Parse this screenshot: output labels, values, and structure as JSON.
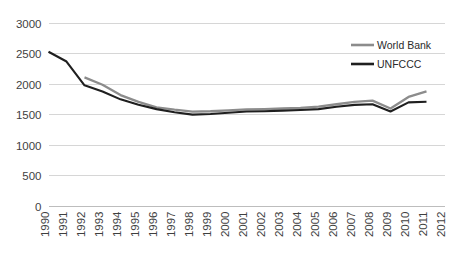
{
  "chart_data": {
    "type": "line",
    "title": "",
    "subtitle": "",
    "xlabel": "",
    "ylabel": "",
    "grid": true,
    "legend_position": "top-right",
    "ylim": [
      0,
      3000
    ],
    "ytick_values": [
      0,
      500,
      1000,
      1500,
      2000,
      2500,
      3000
    ],
    "ytick_labels": [
      "0",
      "500",
      "1000",
      "1500",
      "2000",
      "2500",
      "3000"
    ],
    "categories": [
      "1990",
      "1991",
      "1992",
      "1993",
      "1994",
      "1995",
      "1996",
      "1997",
      "1998",
      "1999",
      "2000",
      "2001",
      "2002",
      "2003",
      "2004",
      "2005",
      "2006",
      "2007",
      "2008",
      "2009",
      "2010",
      "2011",
      "2012"
    ],
    "x": [
      1990,
      1991,
      1992,
      1993,
      1994,
      1995,
      1996,
      1997,
      1998,
      1999,
      2000,
      2001,
      2002,
      2003,
      2004,
      2005,
      2006,
      2007,
      2008,
      2009,
      2010,
      2011,
      2012
    ],
    "series": [
      {
        "name": "World Bank",
        "color": "#8c8c8c",
        "values": [
          null,
          null,
          2100,
          1980,
          1810,
          1700,
          1610,
          1570,
          1540,
          1545,
          1560,
          1575,
          1580,
          1590,
          1600,
          1620,
          1660,
          1700,
          1720,
          1590,
          1780,
          1870,
          null
        ]
      },
      {
        "name": "UNFCCC",
        "color": "#1f1f1f",
        "values": [
          2520,
          2360,
          1970,
          1870,
          1740,
          1650,
          1580,
          1530,
          1490,
          1500,
          1520,
          1540,
          1545,
          1555,
          1565,
          1580,
          1620,
          1650,
          1660,
          1540,
          1690,
          1700,
          null
        ]
      }
    ]
  },
  "legend": {
    "entries": [
      {
        "label": "World Bank",
        "color": "#8c8c8c"
      },
      {
        "label": "UNFCCC",
        "color": "#1f1f1f"
      }
    ]
  }
}
